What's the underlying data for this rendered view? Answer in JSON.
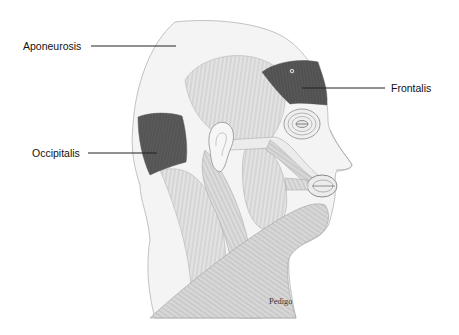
{
  "diagram": {
    "labels": [
      {
        "id": "aponeurosis",
        "text": "Aponeurosis"
      },
      {
        "id": "frontalis",
        "text": "Frontalis"
      },
      {
        "id": "occipitalis",
        "text": "Occipitalis"
      }
    ],
    "credit": "Pedigo",
    "colors": {
      "highlight_muscle": "#5a5a5a",
      "muscle_stroke": "#9a9a9a",
      "skin": "#f3f3f3",
      "outline": "#bdbdbd",
      "leader_line": "#222222"
    }
  }
}
